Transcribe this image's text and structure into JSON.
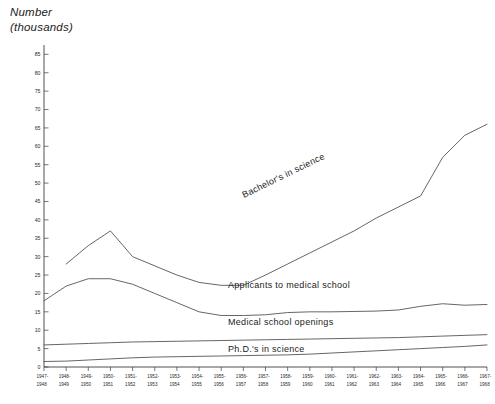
{
  "axis_title": {
    "line1": "Number",
    "line2": "(thousands)"
  },
  "chart_data": {
    "type": "line",
    "title": "Number (thousands)",
    "xlabel": "",
    "ylabel": "Number (thousands)",
    "ylim": [
      0,
      87
    ],
    "ytick_step": 5,
    "grid": false,
    "legend_position": "inline-on-curve",
    "yticks": [
      0,
      5,
      10,
      15,
      20,
      25,
      30,
      35,
      40,
      45,
      50,
      55,
      60,
      65,
      70,
      75,
      80,
      85
    ],
    "ytick_labels": [
      "0",
      "5",
      "10",
      "15",
      "20",
      "25",
      "30",
      "35",
      "40",
      "45",
      "50",
      "55",
      "60",
      "65",
      "70",
      "75",
      "80",
      "85"
    ],
    "categories": [
      "1947-1948",
      "1948-1949",
      "1949-1950",
      "1950-1951",
      "1951-1952",
      "1952-1953",
      "1953-1954",
      "1954-1955",
      "1955-1956",
      "1956-1957",
      "1957-1958",
      "1958-1959",
      "1959-1960",
      "1960-1961",
      "1961-1962",
      "1962-1963",
      "1963-1964",
      "1964-1965",
      "1965-1966",
      "1966-1967",
      "1967-1968"
    ],
    "series": [
      {
        "name": "Bachelor's in science",
        "label": "Bachelor's in science",
        "values": [
          null,
          28.0,
          33.0,
          37.0,
          30.0,
          27.5,
          25.0,
          23.0,
          22.2,
          22.2,
          25.0,
          28.0,
          31.0,
          34.0,
          37.0,
          40.5,
          43.5,
          46.5,
          57.0,
          63.0,
          66.0
        ]
      },
      {
        "name": "Applicants to medical school",
        "label": "Applicants to medical school",
        "values": [
          18.0,
          22.0,
          24.0,
          24.0,
          22.5,
          20.0,
          17.5,
          15.0,
          14.0,
          14.0,
          14.2,
          14.8,
          15.0,
          15.0,
          15.1,
          15.2,
          15.5,
          16.5,
          17.2,
          16.8,
          17.0
        ]
      },
      {
        "name": "Medical school openings",
        "label": "Medical school openings",
        "values": [
          6.0,
          6.2,
          6.4,
          6.6,
          6.8,
          6.9,
          7.0,
          7.1,
          7.2,
          7.3,
          7.4,
          7.5,
          7.6,
          7.7,
          7.8,
          7.9,
          8.0,
          8.2,
          8.4,
          8.6,
          8.8
        ]
      },
      {
        "name": "Ph.D.'s in science",
        "label": "Ph.D.'s in science",
        "values": [
          1.5,
          1.6,
          1.9,
          2.2,
          2.5,
          2.7,
          2.8,
          2.9,
          3.0,
          3.1,
          3.2,
          3.3,
          3.5,
          3.8,
          4.1,
          4.4,
          4.7,
          5.0,
          5.3,
          5.6,
          6.0
        ]
      }
    ]
  },
  "colors": {
    "line": "#555555",
    "axis": "#3d3d3d",
    "text": "#1b1b1b",
    "background": "#ffffff"
  }
}
